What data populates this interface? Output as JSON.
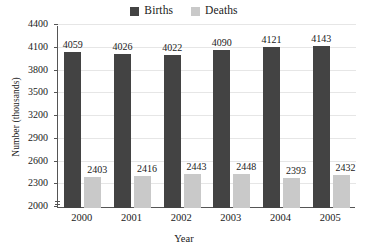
{
  "chart_data": {
    "type": "bar",
    "title": "",
    "xlabel": "Year",
    "ylabel": "Number (thousands)",
    "categories": [
      "2000",
      "2001",
      "2002",
      "2003",
      "2004",
      "2005"
    ],
    "series": [
      {
        "name": "Births",
        "color": "#434343",
        "values": [
          4059,
          4026,
          4022,
          4090,
          4121,
          4143
        ]
      },
      {
        "name": "Deaths",
        "color": "#c9c9c9",
        "values": [
          2403,
          2416,
          2443,
          2448,
          2393,
          2432
        ]
      }
    ],
    "ylim": [
      2000,
      4400
    ],
    "ytick_step": 300,
    "yticks": [
      2000,
      2300,
      2600,
      2900,
      3200,
      3500,
      3800,
      4100,
      4400
    ],
    "ytick_labels": [
      "2000",
      "2300",
      "2600",
      "2900",
      "3200",
      "3500",
      "3800",
      "4100",
      "4400"
    ],
    "grid": true,
    "grid_axis": "y",
    "axis_break": true,
    "legend_position": "top-center",
    "data_labels": true
  },
  "legend": {
    "entries": [
      {
        "label": "Births",
        "swatch": "legend-swatch-births"
      },
      {
        "label": "Deaths",
        "swatch": "legend-swatch-deaths"
      }
    ]
  }
}
